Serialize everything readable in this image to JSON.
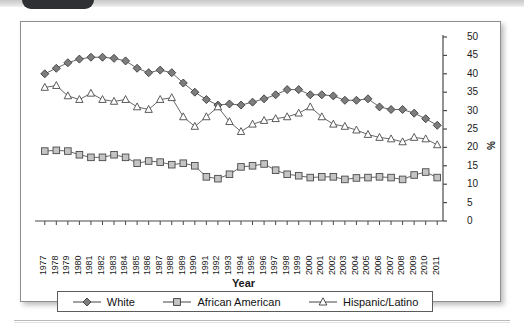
{
  "chart_data": {
    "type": "line",
    "title": "",
    "xlabel": "Year",
    "ylabel": "%",
    "ylim": [
      0,
      50
    ],
    "yticks": [
      0,
      5,
      10,
      15,
      20,
      25,
      30,
      35,
      40,
      45,
      50
    ],
    "grid": false,
    "legend_position": "bottom",
    "x": [
      "1977",
      "1978",
      "1979",
      "1980",
      "1981",
      "1982",
      "1983",
      "1984",
      "1985",
      "1986",
      "1987",
      "1988",
      "1989",
      "1990",
      "1991",
      "1992",
      "1993",
      "1994",
      "1995",
      "1996",
      "1997",
      "1998",
      "1999",
      "2000",
      "2001",
      "2002",
      "2003",
      "2004",
      "2005",
      "2006",
      "2007",
      "2008",
      "2009",
      "2010",
      "2011"
    ],
    "categories": [
      "1977",
      "1978",
      "1979",
      "1980",
      "1981",
      "1982",
      "1983",
      "1984",
      "1985",
      "1986",
      "1987",
      "1988",
      "1989",
      "1990",
      "1991",
      "1992",
      "1993",
      "1994",
      "1995",
      "1996",
      "1997",
      "1998",
      "1999",
      "2000",
      "2001",
      "2002",
      "2003",
      "2004",
      "2005",
      "2006",
      "2007",
      "2008",
      "2009",
      "2010",
      "2011"
    ],
    "series": [
      {
        "name": "White",
        "marker": "filled-diamond",
        "color": "#7d7d7d",
        "values": [
          40.0,
          41.5,
          43.0,
          44.0,
          44.5,
          44.5,
          44.2,
          43.5,
          41.5,
          40.3,
          41.0,
          40.3,
          37.5,
          35.0,
          33.0,
          31.5,
          31.8,
          31.5,
          32.3,
          33.2,
          34.3,
          35.7,
          35.7,
          34.3,
          34.3,
          34.0,
          32.8,
          32.8,
          33.2,
          31.0,
          30.3,
          30.3,
          29.3,
          27.8,
          26.0
        ]
      },
      {
        "name": "African American",
        "marker": "open-square",
        "color": "#c4c4c4",
        "values": [
          19.0,
          19.2,
          19.0,
          18.0,
          17.3,
          17.3,
          18.0,
          17.3,
          15.7,
          16.3,
          16.0,
          15.3,
          15.7,
          15.0,
          12.0,
          11.5,
          12.7,
          14.7,
          15.0,
          15.5,
          13.8,
          12.7,
          12.3,
          11.8,
          12.0,
          12.0,
          11.3,
          11.7,
          11.8,
          12.0,
          11.8,
          11.3,
          12.5,
          13.3,
          11.8
        ]
      },
      {
        "name": "Hispanic/Latino",
        "marker": "open-triangle",
        "color": "#ffffff",
        "values": [
          36.3,
          36.8,
          34.0,
          33.0,
          34.7,
          33.0,
          32.5,
          33.0,
          31.0,
          30.3,
          33.0,
          33.5,
          28.3,
          25.7,
          28.3,
          31.0,
          27.0,
          24.3,
          26.3,
          27.3,
          27.8,
          28.3,
          29.3,
          31.0,
          28.3,
          26.3,
          25.7,
          24.7,
          23.5,
          22.7,
          22.3,
          21.5,
          22.7,
          22.3,
          20.7
        ]
      }
    ]
  },
  "axis": {
    "ylabel": "%",
    "xlabel": "Year"
  },
  "legend": {
    "entries": [
      {
        "label": "White",
        "marker": "filled-diamond"
      },
      {
        "label": "African American",
        "marker": "open-square"
      },
      {
        "label": "Hispanic/Latino",
        "marker": "open-triangle"
      }
    ]
  }
}
